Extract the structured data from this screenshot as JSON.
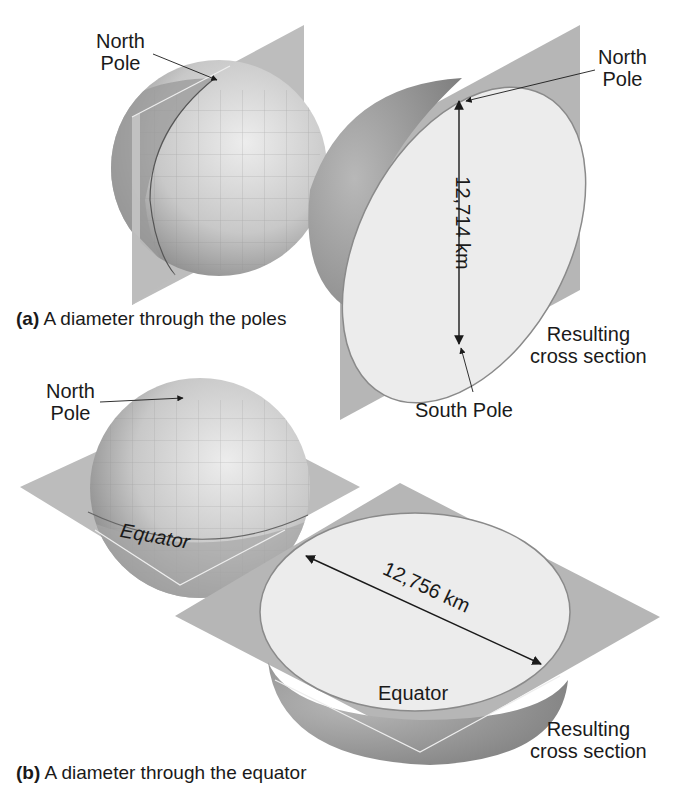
{
  "panel_a": {
    "caption_letter": "(a)",
    "caption_text": "A diameter through the poles",
    "globe_label_north": [
      "North",
      "Pole"
    ],
    "section_label_north": [
      "North",
      "Pole"
    ],
    "section_label_south": "South Pole",
    "measurement": "12,714 km",
    "result_label": [
      "Resulting",
      "cross section"
    ]
  },
  "panel_b": {
    "caption_letter": "(b)",
    "caption_text": "A diameter through the equator",
    "globe_label_north": [
      "North",
      "Pole"
    ],
    "globe_label_equator": "Equator",
    "section_label_equator": "Equator",
    "measurement": "12,756 km",
    "result_label": [
      "Resulting",
      "cross section"
    ]
  },
  "colors": {
    "plane": "#b4b4b4",
    "globe_dark": "#8a8a8a",
    "globe_light": "#d9d9d9",
    "section_face": "#ececec",
    "arrow": "#1a1a1a"
  }
}
